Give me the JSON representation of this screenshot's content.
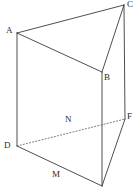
{
  "figure": {
    "kind": "triangular-prism-diagram",
    "background_color": "#ffffff",
    "solid_edge_color": "#3b3b3b",
    "hidden_edge_color": "#6e6e6e",
    "label_color": "#2b2b2b",
    "width": 138,
    "height": 191
  },
  "labels": {
    "a": "A",
    "b": "B",
    "c": "C",
    "d": "D",
    "f": "F",
    "m": "M",
    "n": "N"
  },
  "label_positions": {
    "a": {
      "x": 6,
      "y": 26
    },
    "b": {
      "x": 104,
      "y": 73
    },
    "c": {
      "x": 127,
      "y": 0
    },
    "d": {
      "x": 4,
      "y": 141
    },
    "f": {
      "x": 127,
      "y": 112
    },
    "m": {
      "x": 52,
      "y": 170
    },
    "n": {
      "x": 65,
      "y": 115
    }
  },
  "vertices": {
    "A": {
      "x": 17,
      "y": 33
    },
    "B": {
      "x": 102,
      "y": 72
    },
    "C": {
      "x": 124,
      "y": 5
    },
    "D": {
      "x": 17,
      "y": 146
    },
    "E": {
      "x": 102,
      "y": 186
    },
    "F": {
      "x": 125,
      "y": 119
    }
  },
  "edges": [
    {
      "name": "edge-ac",
      "from": "A",
      "to": "C",
      "style": "solid",
      "path": "M 17 33 L 124 5"
    },
    {
      "name": "edge-ab",
      "from": "A",
      "to": "B",
      "style": "solid",
      "path": "M 17 33 L 102 72"
    },
    {
      "name": "edge-bc",
      "from": "B",
      "to": "C",
      "style": "solid",
      "path": "M 102 72 L 124 5"
    },
    {
      "name": "edge-ad",
      "from": "A",
      "to": "D",
      "style": "solid",
      "path": "M 17 33 L 17 146"
    },
    {
      "name": "edge-be",
      "from": "B",
      "to": "E",
      "style": "solid",
      "path": "M 102 72 L 102 186"
    },
    {
      "name": "edge-cf",
      "from": "C",
      "to": "F",
      "style": "solid",
      "path": "M 124 5 L 125 119"
    },
    {
      "name": "edge-de",
      "from": "D",
      "to": "E",
      "style": "solid",
      "path": "M 17 146 L 102 186"
    },
    {
      "name": "edge-ef",
      "from": "E",
      "to": "F",
      "style": "solid",
      "path": "M 102 186 L 125 119"
    },
    {
      "name": "edge-df-hidden",
      "from": "D",
      "to": "F",
      "style": "hidden",
      "path": "M 17 146 L 125 119"
    }
  ]
}
